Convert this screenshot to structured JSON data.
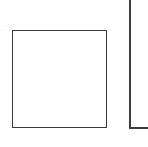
{
  "canvas": {
    "width": 148,
    "height": 147,
    "background_color": "#ffffff",
    "stroke_color": "#3c3c3c",
    "stroke_width_px": 1.5,
    "description": "Two thin dark-gray outlined geometric shapes on a plain white background: a closed square on the left and a partially cropped rectangle corner on the right."
  },
  "shapes": [
    {
      "id": "square",
      "label": "square-outline",
      "kind": "rectangle",
      "closed": true,
      "fill": "#ffffff",
      "stroke": "#3c3c3c",
      "x": 12,
      "y": 30,
      "width": 95,
      "height": 98
    },
    {
      "id": "cropped-corner",
      "label": "cropped-rectangle-corner",
      "kind": "open-path",
      "closed": false,
      "stroke": "#3c3c3c",
      "vertical_edge": {
        "x": 129,
        "y": 0,
        "height": 129
      },
      "horizontal_edge": {
        "x": 129,
        "y": 127,
        "width": 19
      },
      "note": "Left and bottom edges of a rectangle whose top and right sides fall outside the image frame."
    }
  ],
  "artifacts": {
    "speckles": [
      {
        "x": 5,
        "y": 26,
        "width": 2,
        "height": 1
      },
      {
        "x": 8,
        "y": 24,
        "width": 2,
        "height": 1
      },
      {
        "x": 3,
        "y": 29,
        "width": 1,
        "height": 1
      },
      {
        "x": 10,
        "y": 27,
        "width": 1,
        "height": 2
      }
    ]
  }
}
